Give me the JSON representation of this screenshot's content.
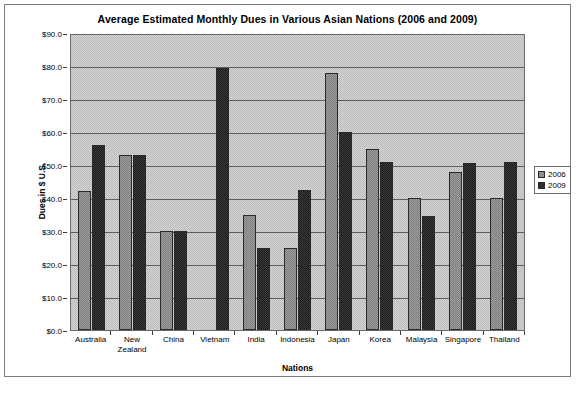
{
  "chart_data": {
    "type": "bar",
    "title": "Average Estimated Monthly Dues in Various Asian Nations (2006 and 2009)",
    "xlabel": "Nations",
    "ylabel": "Dues in $ U.S.",
    "categories": [
      "Australia",
      "New Zealand",
      "China",
      "Vietnam",
      "India",
      "Indonesia",
      "Japan",
      "Korea",
      "Malaysia",
      "Singapore",
      "Thailand"
    ],
    "series": [
      {
        "name": "2006",
        "color": "#8f8f8f",
        "values": [
          42,
          53,
          30,
          null,
          35,
          25,
          78,
          55,
          40,
          48,
          40
        ]
      },
      {
        "name": "2009",
        "color": "#2e2e2e",
        "values": [
          56,
          53,
          30,
          79.5,
          25,
          42.5,
          60,
          51,
          34.5,
          50.5,
          51
        ]
      }
    ],
    "ylim": [
      0,
      90
    ],
    "ytick_values": [
      0,
      10,
      20,
      30,
      40,
      50,
      60,
      70,
      80,
      90
    ],
    "ytick_labels": [
      "$0.0",
      "$10.0",
      "$20.0",
      "$30.0",
      "$40.0",
      "$50.0",
      "$60.0",
      "$70.0",
      "$80.0",
      "$90.0"
    ],
    "grid": true,
    "legend_position": "right"
  },
  "legend": {
    "items": [
      {
        "label": "2006"
      },
      {
        "label": "2009"
      }
    ]
  }
}
